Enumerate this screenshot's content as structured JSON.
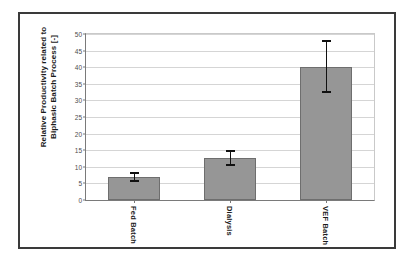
{
  "figure": {
    "background_color": "#ffffff",
    "frame_color": "#3a3a3a",
    "bar_fill_color": "#969696",
    "bar_edge_color": "#6e6e6e",
    "gridline_color": "#d5d5d5",
    "axis_color": "#7a7a7a",
    "errorbar_color": "#111111"
  },
  "chart_data": {
    "type": "bar",
    "title": "",
    "subtitle": "",
    "xlabel": "",
    "ylabel": "Relative Productivity related to Biphasic Batch Process [-]",
    "ylabel_line1": "Relative Productivity related to",
    "ylabel_line2": "Biphasic Batch Process [-]",
    "categories": [
      "Fed Batch",
      "Dialysis",
      "VEF Batch"
    ],
    "values": [
      7.0,
      12.7,
      40.2
    ],
    "errors_upper": [
      1.5,
      2.4,
      8.1
    ],
    "errors_lower": [
      1.5,
      2.4,
      7.9
    ],
    "ylim": [
      0,
      50
    ],
    "ytick_step": 5,
    "yticks": [
      0,
      5,
      10,
      15,
      20,
      25,
      30,
      35,
      40,
      45,
      50
    ],
    "ytick_labels": [
      "0",
      "5",
      "10",
      "15",
      "20",
      "25",
      "30",
      "35",
      "40",
      "45",
      "50"
    ],
    "grid": true,
    "grid_axis": "y",
    "legend": false,
    "legend_position": "none",
    "annotations": []
  }
}
